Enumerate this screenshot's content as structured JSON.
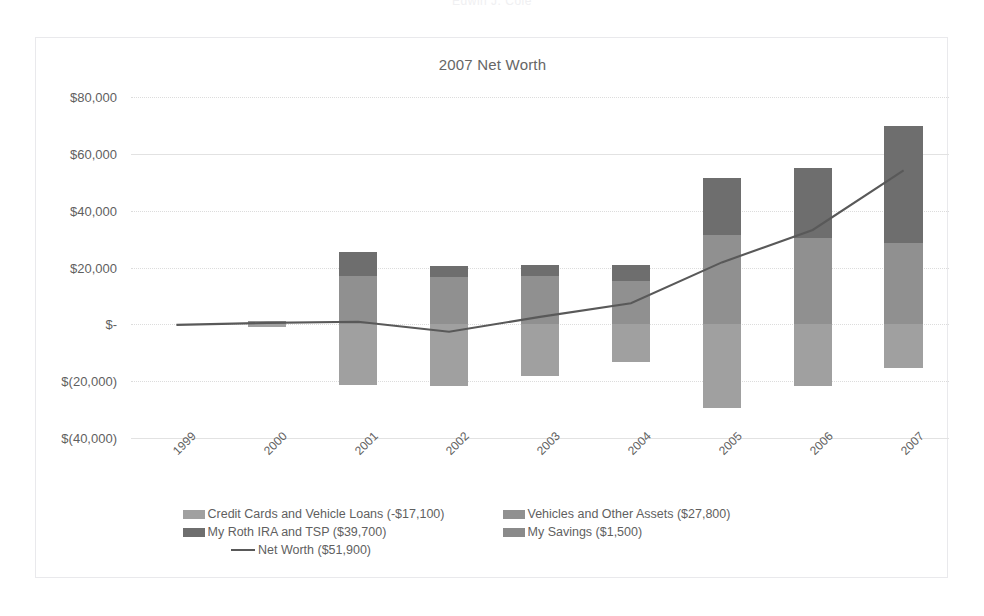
{
  "clipped_header": "Edwin J. Cole",
  "chart_data": {
    "type": "bar",
    "title": "2007 Net Worth",
    "xlabel": "",
    "ylabel": "",
    "ylim": [
      -40000,
      80000
    ],
    "grid": true,
    "legend_position": "bottom",
    "categories": [
      "1999",
      "2000",
      "2001",
      "2002",
      "2003",
      "2004",
      "2005",
      "2006",
      "2007"
    ],
    "ytick_labels": [
      "$80,000",
      "$60,000",
      "$40,000",
      "$20,000",
      "$-",
      "$(20,000)",
      "$(40,000)"
    ],
    "ytick_values": [
      80000,
      60000,
      40000,
      20000,
      0,
      -20000,
      -40000
    ],
    "series": [
      {
        "name": "Credit Cards and Vehicle Loans (-$17,100)",
        "key": "credit",
        "color": "#a0a0a0",
        "type": "bar",
        "values": [
          0,
          -800,
          -21500,
          -21600,
          -18200,
          -13400,
          -29600,
          -21700,
          -15500
        ]
      },
      {
        "name": "Vehicles and Other Assets ($27,800)",
        "key": "vehicles",
        "color": "#909090",
        "type": "bar",
        "values": [
          0,
          1300,
          17000,
          16800,
          16900,
          15200,
          31500,
          30300,
          28600
        ]
      },
      {
        "name": "My Roth IRA and TSP ($39,700)",
        "key": "roth",
        "color": "#6e6e6e",
        "type": "bar",
        "values": [
          0,
          0,
          8400,
          3800,
          3900,
          5600,
          19900,
          24600,
          41100
        ]
      },
      {
        "name": "My Savings ($1,500)",
        "key": "savings",
        "color": "#8a8a8a",
        "type": "bar",
        "values": [
          0,
          0,
          0,
          0,
          0,
          0,
          0,
          0,
          0
        ]
      },
      {
        "name": "Net Worth ($51,900)",
        "key": "networth",
        "color": "#595959",
        "type": "line",
        "values": [
          -200,
          500,
          900,
          -2600,
          2600,
          7400,
          21800,
          33200,
          54200
        ]
      }
    ],
    "legend_rows": [
      [
        "Credit Cards and Vehicle Loans (-$17,100)",
        "Vehicles and Other Assets ($27,800)"
      ],
      [
        "My Roth IRA and TSP ($39,700)",
        "My Savings ($1,500)"
      ],
      [
        "Net Worth ($51,900)"
      ]
    ]
  }
}
